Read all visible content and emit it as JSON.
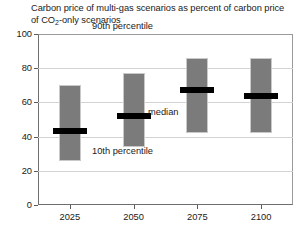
{
  "chart_data": {
    "type": "bar",
    "title": "Carbon price of multi-gas scenarios as percent of carbon price of CO2-only scenarios",
    "title_part1": "Carbon price of multi-gas scenarios as percent of carbon price of CO",
    "title_sub": "2",
    "title_part2": "-only scenarios",
    "xlabel": "",
    "ylabel": "",
    "categories": [
      "2025",
      "2050",
      "2075",
      "2100"
    ],
    "ylim": [
      0,
      100
    ],
    "yticks": [
      0,
      20,
      40,
      60,
      80,
      100
    ],
    "ytick_labels": [
      "0",
      "20",
      "40",
      "60",
      "80",
      "100"
    ],
    "grid": true,
    "legend": "none",
    "series": [
      {
        "name": "10th percentile",
        "values": [
          26,
          34,
          42,
          42
        ]
      },
      {
        "name": "median",
        "values": [
          43,
          52,
          67,
          64
        ]
      },
      {
        "name": "90th percentile",
        "values": [
          70,
          77,
          86,
          86
        ]
      }
    ],
    "bars": [
      {
        "category": "2025",
        "p10": 26,
        "median": 43,
        "p90": 70
      },
      {
        "category": "2050",
        "p10": 34,
        "median": 52,
        "p90": 77
      },
      {
        "category": "2075",
        "p10": 42,
        "median": 67,
        "p90": 86
      },
      {
        "category": "2100",
        "p10": 42,
        "median": 64,
        "p90": 86
      }
    ],
    "annotations": [
      {
        "text": "90th percentile",
        "target": "bar-top"
      },
      {
        "text": "median",
        "target": "median-mark"
      },
      {
        "text": "10th percentile",
        "target": "bar-bottom"
      }
    ],
    "colors": {
      "bar_fill": "#7b7b7b",
      "median_mark": "#000000",
      "gridline": "#d3d3d3",
      "axis": "#5a5a5a",
      "text": "#1a1a1a",
      "background": "#ffffff"
    }
  }
}
